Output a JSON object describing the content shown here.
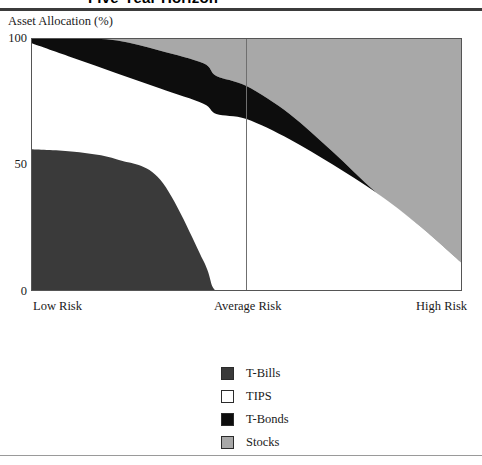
{
  "figure": {
    "title": "Five-Year Horizon",
    "y_axis_label": "Asset Allocation (%)"
  },
  "axes": {
    "y_ticks": [
      "100",
      "50",
      "0"
    ],
    "x_ticks": [
      "Low Risk",
      "Average Risk",
      "High Risk"
    ]
  },
  "legend": {
    "items": [
      {
        "label": "T-Bills",
        "color": "#3a3a3a"
      },
      {
        "label": "TIPS",
        "color": "#ffffff"
      },
      {
        "label": "T-Bonds",
        "color": "#0d0d0d"
      },
      {
        "label": "Stocks",
        "color": "#a8a8a8"
      }
    ]
  },
  "colors": {
    "t_bills": "#3a3a3a",
    "tips": "#ffffff",
    "t_bonds": "#0d0d0d",
    "stocks": "#a8a8a8",
    "axis": "#555555",
    "divider": "#6f6f6f"
  },
  "chart_data": {
    "type": "area",
    "title": "Five-Year Horizon",
    "xlabel": "",
    "ylabel": "Asset Allocation (%)",
    "ylim": [
      0,
      100
    ],
    "grid": false,
    "legend_position": "bottom-center",
    "stacked": true,
    "stack_order_bottom_to_top": [
      "T-Bills",
      "TIPS",
      "T-Bonds",
      "Stocks"
    ],
    "x": [
      0,
      10,
      20,
      30,
      40,
      43,
      50,
      60,
      70,
      80,
      90,
      100
    ],
    "x_tick_positions": [
      0,
      50,
      100
    ],
    "x_tick_labels": [
      "Low Risk",
      "Average Risk",
      "High Risk"
    ],
    "series": [
      {
        "name": "T-Bills",
        "values": [
          56,
          55,
          52,
          44,
          12,
          0,
          0,
          0,
          0,
          0,
          0,
          0
        ]
      },
      {
        "name": "TIPS",
        "values": [
          42,
          37,
          34,
          36,
          62,
          70,
          68,
          60,
          50,
          39,
          26,
          11
        ]
      },
      {
        "name": "T-Bonds",
        "values": [
          2,
          8,
          13,
          15,
          16,
          15,
          13,
          10,
          5,
          0,
          0,
          0
        ]
      },
      {
        "name": "Stocks",
        "values": [
          0,
          0,
          1,
          5,
          10,
          15,
          19,
          30,
          45,
          61,
          74,
          89
        ]
      }
    ],
    "cumulative_upper_bounds": {
      "t_bills": [
        56,
        55,
        52,
        44,
        12,
        0,
        0,
        0,
        0,
        0,
        0,
        0
      ],
      "tips": [
        98,
        92,
        86,
        80,
        74,
        70,
        68,
        60,
        50,
        39,
        26,
        11
      ],
      "t_bonds": [
        100,
        100,
        99,
        95,
        90,
        85,
        81,
        70,
        55,
        39,
        26,
        11
      ],
      "stocks": [
        100,
        100,
        100,
        100,
        100,
        100,
        100,
        100,
        100,
        100,
        100,
        100
      ]
    }
  }
}
